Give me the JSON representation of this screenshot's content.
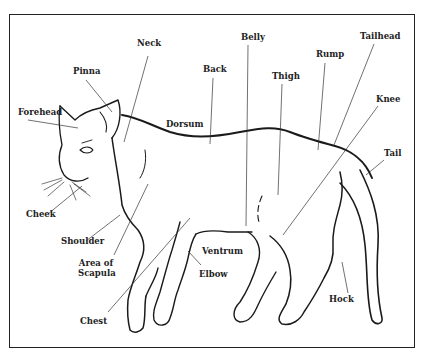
{
  "diagram": {
    "labels": {
      "neck": "Neck",
      "pinna": "Pinna",
      "forehead": "Forehead",
      "back": "Back",
      "dorsum": "Dorsum",
      "belly": "Belly",
      "thigh": "Thigh",
      "rump": "Rump",
      "tailhead": "Tailhead",
      "knee": "Knee",
      "tail": "Tail",
      "cheek": "Cheek",
      "shoulder": "Shoulder",
      "area_of_scapula_1": "Area of",
      "area_of_scapula_2": "Scapula",
      "ventrum": "Ventrum",
      "elbow": "Elbow",
      "chest": "Chest",
      "hock": "Hock"
    },
    "colors": {
      "line": "#222222",
      "background": "#ffffff"
    }
  }
}
